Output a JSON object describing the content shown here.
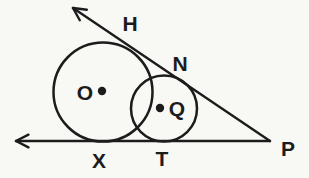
{
  "colors": {
    "background": "#f8f8f5",
    "ink": "#1c1c1c"
  },
  "diagram": {
    "width": 309,
    "height": 178,
    "line_stroke_width": 2.4,
    "circle_stroke_width": 2.5,
    "font_size": 21,
    "arrow": {
      "length": 14,
      "half_angle_deg": 27
    },
    "lines": [
      {
        "name": "tangent-line-P-through-N-H",
        "x1": 270,
        "y1": 141,
        "x2": 73,
        "y2": 8,
        "arrow_at_end": true
      },
      {
        "name": "tangent-line-P-through-T-X",
        "x1": 270,
        "y1": 141,
        "x2": 16,
        "y2": 141,
        "arrow_at_end": true
      }
    ],
    "circles": [
      {
        "name": "circle-O",
        "cx": 103,
        "cy": 92,
        "r": 49.5
      },
      {
        "name": "circle-Q",
        "cx": 164,
        "cy": 108.5,
        "r": 33
      }
    ],
    "center_dots": [
      {
        "name": "center-dot-O",
        "cx": 102,
        "cy": 91,
        "r": 4.2
      },
      {
        "name": "center-dot-Q",
        "cx": 160,
        "cy": 108,
        "r": 4.2
      }
    ],
    "labels": [
      {
        "name": "label-H",
        "text": "H",
        "x": 130,
        "y": 31
      },
      {
        "name": "label-N",
        "text": "N",
        "x": 180,
        "y": 71
      },
      {
        "name": "label-O",
        "text": "O",
        "x": 85,
        "y": 100
      },
      {
        "name": "label-Q",
        "text": "Q",
        "x": 177,
        "y": 116
      },
      {
        "name": "label-X",
        "text": "X",
        "x": 99,
        "y": 168
      },
      {
        "name": "label-T",
        "text": "T",
        "x": 162,
        "y": 166
      },
      {
        "name": "label-P",
        "text": "P",
        "x": 288,
        "y": 156
      }
    ]
  }
}
